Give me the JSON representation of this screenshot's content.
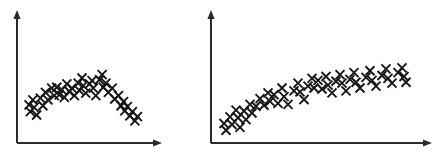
{
  "figure": {
    "name": "two-scatter-plots",
    "background_color": "#ffffff",
    "marker_color": "#161616",
    "axis_color": "#2b2b2b",
    "marker_symbol": "x",
    "marker_size": 9
  },
  "panels": [
    {
      "id": "left",
      "name": "inverted-u-scatter",
      "axis": {
        "x_start": 17,
        "x_end": 160,
        "y_baseline": 143,
        "y_top": 13,
        "arrowheads": true,
        "ticks": false,
        "labels": false
      }
    },
    {
      "id": "right",
      "name": "saturating-scatter",
      "axis": {
        "x_start": 11,
        "x_end": 230,
        "y_baseline": 143,
        "y_top": 13,
        "arrowheads": true,
        "ticks": false,
        "labels": false
      }
    }
  ],
  "chart_data": [
    {
      "type": "scatter",
      "id": "left",
      "title": "",
      "xlabel": "",
      "ylabel": "",
      "xlim": [
        0,
        100
      ],
      "ylim": [
        0,
        100
      ],
      "grid": false,
      "legend": false,
      "shape": "inverted-u (concave, rises then falls)",
      "marker": "x",
      "series": [
        {
          "name": "observations",
          "points": [
            [
              4,
              37
            ],
            [
              5,
              29
            ],
            [
              7,
              43
            ],
            [
              8,
              34
            ],
            [
              10,
              25
            ],
            [
              13,
              45
            ],
            [
              15,
              36
            ],
            [
              17,
              52
            ],
            [
              19,
              43
            ],
            [
              22,
              57
            ],
            [
              24,
              48
            ],
            [
              26,
              58
            ],
            [
              28,
              49
            ],
            [
              30,
              55
            ],
            [
              32,
              46
            ],
            [
              34,
              62
            ],
            [
              36,
              53
            ],
            [
              38,
              57
            ],
            [
              40,
              48
            ],
            [
              43,
              63
            ],
            [
              44,
              54
            ],
            [
              46,
              69
            ],
            [
              47,
              60
            ],
            [
              49,
              51
            ],
            [
              52,
              62
            ],
            [
              54,
              66
            ],
            [
              55,
              57
            ],
            [
              57,
              48
            ],
            [
              60,
              67
            ],
            [
              62,
              73
            ],
            [
              63,
              58
            ],
            [
              65,
              63
            ],
            [
              67,
              52
            ],
            [
              70,
              57
            ],
            [
              72,
              44
            ],
            [
              75,
              48
            ],
            [
              77,
              36
            ],
            [
              79,
              41
            ],
            [
              80,
              30
            ],
            [
              82,
              35
            ],
            [
              84,
              24
            ],
            [
              86,
              29
            ],
            [
              88,
              18
            ],
            [
              90,
              23
            ]
          ]
        }
      ]
    },
    {
      "type": "scatter",
      "id": "right",
      "title": "",
      "xlabel": "",
      "ylabel": "",
      "xlim": [
        0,
        100
      ],
      "ylim": [
        0,
        100
      ],
      "grid": false,
      "legend": false,
      "shape": "increasing then plateau (saturating / concave increasing)",
      "marker": "x",
      "series": [
        {
          "name": "observations",
          "points": [
            [
              3,
              13
            ],
            [
              4,
              6
            ],
            [
              6,
              20
            ],
            [
              7,
              12
            ],
            [
              9,
              27
            ],
            [
              10,
              19
            ],
            [
              11,
              9
            ],
            [
              13,
              26
            ],
            [
              14,
              17
            ],
            [
              16,
              33
            ],
            [
              17,
              24
            ],
            [
              19,
              31
            ],
            [
              21,
              39
            ],
            [
              23,
              32
            ],
            [
              25,
              45
            ],
            [
              26,
              36
            ],
            [
              28,
              43
            ],
            [
              30,
              34
            ],
            [
              32,
              50
            ],
            [
              33,
              41
            ],
            [
              35,
              33
            ],
            [
              38,
              47
            ],
            [
              40,
              55
            ],
            [
              41,
              46
            ],
            [
              43,
              38
            ],
            [
              45,
              52
            ],
            [
              47,
              60
            ],
            [
              48,
              50
            ],
            [
              50,
              58
            ],
            [
              52,
              49
            ],
            [
              54,
              62
            ],
            [
              55,
              53
            ],
            [
              57,
              45
            ],
            [
              59,
              57
            ],
            [
              61,
              64
            ],
            [
              62,
              55
            ],
            [
              64,
              47
            ],
            [
              66,
              59
            ],
            [
              68,
              66
            ],
            [
              69,
              56
            ],
            [
              71,
              50
            ],
            [
              74,
              61
            ],
            [
              76,
              68
            ],
            [
              77,
              58
            ],
            [
              79,
              52
            ],
            [
              82,
              63
            ],
            [
              84,
              70
            ],
            [
              85,
              60
            ],
            [
              87,
              55
            ],
            [
              90,
              66
            ],
            [
              92,
              71
            ],
            [
              93,
              62
            ],
            [
              94,
              56
            ]
          ]
        }
      ]
    }
  ]
}
